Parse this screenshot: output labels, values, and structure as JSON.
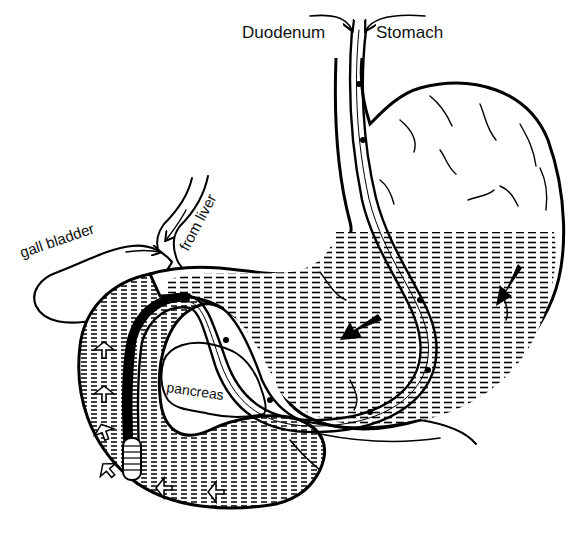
{
  "diagram": {
    "type": "anatomical-illustration",
    "style": "black-and-white line drawing",
    "labels": {
      "duodenum": "Duodenum",
      "stomach": "Stomach",
      "gall_bladder": "gall bladder",
      "from_liver": "from liver",
      "pancreas": "pancreas"
    },
    "structures": [
      {
        "id": "stomach",
        "label": "Stomach"
      },
      {
        "id": "duodenum",
        "label": "Duodenum"
      },
      {
        "id": "gall-bladder",
        "label": "gall bladder"
      },
      {
        "id": "bile-duct",
        "label": "from liver"
      },
      {
        "id": "pancreas",
        "label": "pancreas"
      },
      {
        "id": "feeding-tube",
        "label": ""
      }
    ],
    "arrows": [
      {
        "id": "label-arrow-duodenum",
        "direction": "down-right",
        "points_to": "tube-entry"
      },
      {
        "id": "label-arrow-stomach",
        "direction": "down-left",
        "points_to": "tube-entry"
      },
      {
        "id": "flow-arrow-stomach-center",
        "direction": "down-left",
        "style": "solid-black"
      },
      {
        "id": "flow-arrow-stomach-right",
        "direction": "down-left",
        "style": "solid-black"
      },
      {
        "id": "flow-arrows-duodenum",
        "direction": "along-duodenum",
        "style": "hollow-white",
        "count": 6
      },
      {
        "id": "bile-flow-arrows",
        "direction": "toward-duct",
        "style": "thin",
        "count": 2
      }
    ],
    "colors": {
      "ink": "#000000",
      "background": "#ffffff"
    }
  }
}
